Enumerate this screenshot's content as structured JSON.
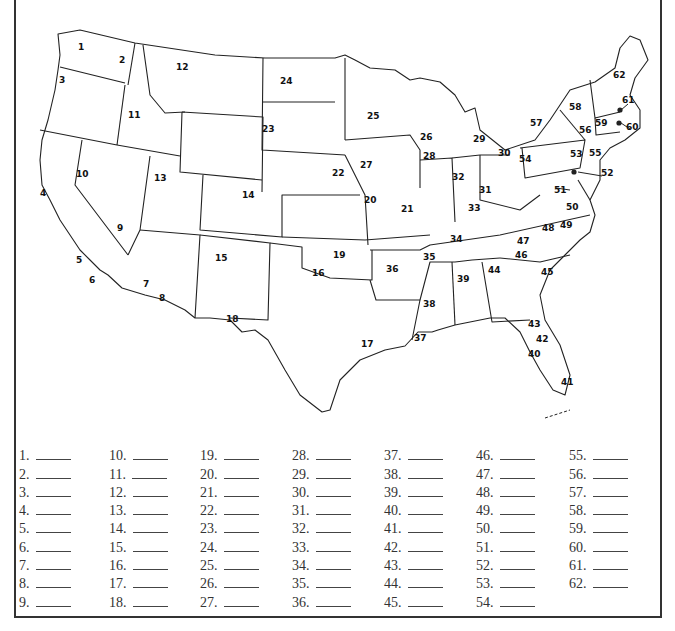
{
  "map": {
    "labels": [
      {
        "n": "1",
        "x": 82,
        "y": 48
      },
      {
        "n": "2",
        "x": 123,
        "y": 61
      },
      {
        "n": "3",
        "x": 63,
        "y": 81
      },
      {
        "n": "4",
        "x": 44,
        "y": 194
      },
      {
        "n": "5",
        "x": 80,
        "y": 261
      },
      {
        "n": "6",
        "x": 93,
        "y": 281
      },
      {
        "n": "7",
        "x": 147,
        "y": 285
      },
      {
        "n": "8",
        "x": 163,
        "y": 299
      },
      {
        "n": "9",
        "x": 121,
        "y": 229
      },
      {
        "n": "10",
        "x": 80,
        "y": 175
      },
      {
        "n": "11",
        "x": 132,
        "y": 116
      },
      {
        "n": "12",
        "x": 180,
        "y": 68
      },
      {
        "n": "13",
        "x": 158,
        "y": 179
      },
      {
        "n": "14",
        "x": 246,
        "y": 196
      },
      {
        "n": "15",
        "x": 219,
        "y": 259
      },
      {
        "n": "16",
        "x": 316,
        "y": 274
      },
      {
        "n": "17",
        "x": 365,
        "y": 345
      },
      {
        "n": "18",
        "x": 230,
        "y": 320
      },
      {
        "n": "19",
        "x": 337,
        "y": 256
      },
      {
        "n": "20",
        "x": 368,
        "y": 201
      },
      {
        "n": "21",
        "x": 405,
        "y": 210
      },
      {
        "n": "22",
        "x": 336,
        "y": 174
      },
      {
        "n": "23",
        "x": 266,
        "y": 130
      },
      {
        "n": "24",
        "x": 284,
        "y": 82
      },
      {
        "n": "25",
        "x": 371,
        "y": 117
      },
      {
        "n": "26",
        "x": 424,
        "y": 138
      },
      {
        "n": "27",
        "x": 364,
        "y": 166
      },
      {
        "n": "28",
        "x": 427,
        "y": 157
      },
      {
        "n": "29",
        "x": 477,
        "y": 140
      },
      {
        "n": "30",
        "x": 502,
        "y": 154
      },
      {
        "n": "31",
        "x": 483,
        "y": 191
      },
      {
        "n": "32",
        "x": 456,
        "y": 178
      },
      {
        "n": "33",
        "x": 472,
        "y": 209
      },
      {
        "n": "34",
        "x": 454,
        "y": 240
      },
      {
        "n": "35",
        "x": 427,
        "y": 258
      },
      {
        "n": "36",
        "x": 390,
        "y": 270
      },
      {
        "n": "37",
        "x": 418,
        "y": 339
      },
      {
        "n": "38",
        "x": 427,
        "y": 305
      },
      {
        "n": "39",
        "x": 461,
        "y": 280
      },
      {
        "n": "40",
        "x": 532,
        "y": 355
      },
      {
        "n": "41",
        "x": 565,
        "y": 383
      },
      {
        "n": "42",
        "x": 540,
        "y": 340
      },
      {
        "n": "43",
        "x": 532,
        "y": 325
      },
      {
        "n": "44",
        "x": 492,
        "y": 271
      },
      {
        "n": "45",
        "x": 545,
        "y": 273
      },
      {
        "n": "46",
        "x": 519,
        "y": 256
      },
      {
        "n": "47",
        "x": 521,
        "y": 242
      },
      {
        "n": "48",
        "x": 546,
        "y": 229
      },
      {
        "n": "49",
        "x": 564,
        "y": 226
      },
      {
        "n": "50",
        "x": 570,
        "y": 208
      },
      {
        "n": "51",
        "x": 558,
        "y": 191
      },
      {
        "n": "52",
        "x": 605,
        "y": 174
      },
      {
        "n": "53",
        "x": 574,
        "y": 155
      },
      {
        "n": "54",
        "x": 523,
        "y": 160
      },
      {
        "n": "55",
        "x": 593,
        "y": 154
      },
      {
        "n": "56",
        "x": 583,
        "y": 131
      },
      {
        "n": "57",
        "x": 534,
        "y": 124
      },
      {
        "n": "58",
        "x": 573,
        "y": 108
      },
      {
        "n": "59",
        "x": 599,
        "y": 124
      },
      {
        "n": "60",
        "x": 630,
        "y": 128
      },
      {
        "n": "61",
        "x": 626,
        "y": 101
      },
      {
        "n": "62",
        "x": 617,
        "y": 76
      }
    ]
  },
  "answer_key": {
    "columns": [
      [
        "1.",
        "2.",
        "3.",
        "4.",
        "5.",
        "6.",
        "7.",
        "8.",
        "9."
      ],
      [
        "10.",
        "11.",
        "12.",
        "13.",
        "14.",
        "15.",
        "16.",
        "17.",
        "18."
      ],
      [
        "19.",
        "20.",
        "21.",
        "22.",
        "23.",
        "24.",
        "25.",
        "26.",
        "27."
      ],
      [
        "28.",
        "29.",
        "30.",
        "31.",
        "32.",
        "33.",
        "34.",
        "35.",
        "36."
      ],
      [
        "37.",
        "38.",
        "39.",
        "40.",
        "41.",
        "42.",
        "43.",
        "44.",
        "45."
      ],
      [
        "46.",
        "47.",
        "48.",
        "49.",
        "50.",
        "51.",
        "52.",
        "53.",
        "54."
      ],
      [
        "55.",
        "56.",
        "57.",
        "58.",
        "59.",
        "60.",
        "61.",
        "62."
      ]
    ]
  }
}
